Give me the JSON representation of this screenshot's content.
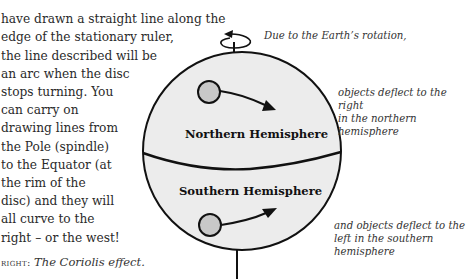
{
  "body_text": {
    "lines": [
      "",
      "have drawn a straight line along the",
      "edge of the stationary ruler,",
      "the line described will be",
      "an arc when the disc",
      "stops turning. You",
      "can carry on",
      "drawing lines from",
      "the Pole (spindle)",
      "to the Equator (at",
      "the rim of the",
      "disc) and they will",
      "all curve to the",
      "right – or the west!"
    ]
  },
  "caption": {
    "lead": "right:",
    "title": "The Coriolis effect."
  },
  "figure": {
    "notes": {
      "rotation": "Due to the Earth’s rotation,",
      "north": [
        "objects deflect to the right",
        "in the northern hemisphere"
      ],
      "south": [
        "and objects deflect to the",
        "left in the southern",
        "hemisphere"
      ]
    },
    "labels": {
      "northern": "Northern Hemisphere",
      "southern": "Southern Hemisphere"
    },
    "colors": {
      "globe_fill": "#ececec",
      "object_fill": "#c8c8c8",
      "stroke": "#111111"
    }
  }
}
